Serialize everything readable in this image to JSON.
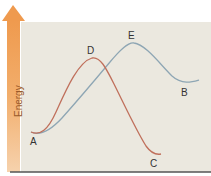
{
  "diagram": {
    "type": "energy-profile",
    "y_axis_label": "Energy",
    "colors": {
      "background": "#ebe8df",
      "arrow": "#f0a15a",
      "red_curve": "#c0705c",
      "blue_curve": "#8ea6b4",
      "baseline": "#555555"
    },
    "points": [
      {
        "id": "A",
        "label": "A",
        "description": "start"
      },
      {
        "id": "D",
        "label": "D",
        "description": "peak of red curve"
      },
      {
        "id": "E",
        "label": "E",
        "description": "peak of blue curve"
      },
      {
        "id": "B",
        "label": "B",
        "description": "end of blue curve"
      },
      {
        "id": "C",
        "label": "C",
        "description": "end of red curve"
      }
    ],
    "curves": [
      {
        "name": "red",
        "path": "A -> D -> C"
      },
      {
        "name": "blue",
        "path": "A -> E -> B"
      }
    ]
  }
}
